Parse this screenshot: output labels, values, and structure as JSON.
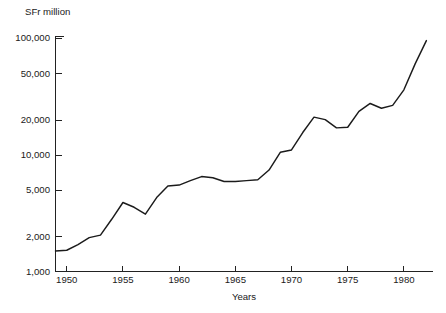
{
  "chart_data": {
    "type": "line",
    "title": "",
    "unit_label": "SFr million",
    "xlabel": "Years",
    "ylabel": "",
    "yscale": "log",
    "ylim": [
      1000,
      100000
    ],
    "xlim": [
      1949,
      1982.5
    ],
    "grid": false,
    "legend": null,
    "y_ticks": [
      1000,
      2000,
      5000,
      10000,
      20000,
      50000,
      100000
    ],
    "y_tick_labels": [
      "1,000",
      "2,000",
      "5,000",
      "10,000",
      "20,000",
      "50,000",
      "100,000"
    ],
    "x_ticks": [
      1950,
      1955,
      1960,
      1965,
      1970,
      1975,
      1980
    ],
    "x_tick_labels": [
      "1950",
      "1955",
      "1960",
      "1965",
      "1970",
      "1975",
      "1980"
    ],
    "series": [
      {
        "name": "SFr million",
        "color": "#1b1b1b",
        "x": [
          1949,
          1950,
          1951,
          1952,
          1953,
          1954,
          1955,
          1956,
          1957,
          1958,
          1959,
          1960,
          1961,
          1962,
          1963,
          1964,
          1965,
          1966,
          1967,
          1968,
          1969,
          1970,
          1971,
          1972,
          1973,
          1974,
          1975,
          1976,
          1977,
          1978,
          1979,
          1980,
          1981,
          1982
        ],
        "values": [
          1500,
          1520,
          1700,
          1950,
          2050,
          2800,
          3900,
          3550,
          3100,
          4300,
          5400,
          5500,
          6000,
          6500,
          6350,
          5900,
          5900,
          6000,
          6100,
          7400,
          10500,
          11000,
          15500,
          21000,
          20000,
          17000,
          17200,
          23500,
          27500,
          25000,
          26500,
          36000,
          60000,
          95000
        ]
      }
    ]
  }
}
